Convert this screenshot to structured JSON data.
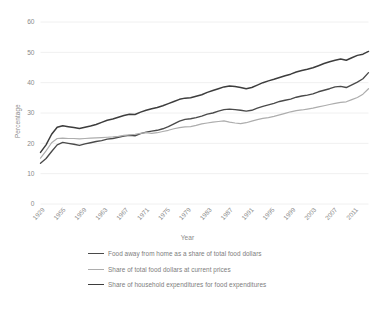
{
  "chart_data": {
    "type": "line",
    "title": "",
    "xlabel": "Year",
    "ylabel": "Percentage",
    "ylim": [
      0,
      60
    ],
    "yticks": [
      0,
      10,
      20,
      30,
      40,
      50,
      60
    ],
    "grid": "horizontal",
    "legend_position": "bottom",
    "x_tick_labels": [
      "1929",
      "1955",
      "1959",
      "1963",
      "1967",
      "1971",
      "1975",
      "1979",
      "1983",
      "1987",
      "1991",
      "1995",
      "1999",
      "2003",
      "2007",
      "2011"
    ],
    "x": [
      1929,
      1955,
      1956,
      1957,
      1958,
      1959,
      1960,
      1961,
      1962,
      1963,
      1964,
      1965,
      1966,
      1967,
      1968,
      1969,
      1970,
      1971,
      1972,
      1973,
      1974,
      1975,
      1976,
      1977,
      1978,
      1979,
      1980,
      1981,
      1982,
      1983,
      1984,
      1985,
      1986,
      1987,
      1988,
      1989,
      1990,
      1991,
      1992,
      1993,
      1994,
      1995,
      1996,
      1997,
      1998,
      1999,
      2000,
      2001,
      2002,
      2003,
      2004,
      2005,
      2006,
      2007,
      2008,
      2009,
      2010,
      2011,
      2012,
      2013
    ],
    "series": [
      {
        "name": "Food away from home as a share of total food dollars",
        "color": "#4a4a4a",
        "values": [
          13.4,
          15.0,
          17.3,
          19.5,
          20.3,
          20.0,
          19.7,
          19.3,
          19.8,
          20.2,
          20.6,
          20.9,
          21.4,
          21.6,
          22.0,
          22.4,
          22.6,
          22.5,
          23.2,
          23.7,
          24.0,
          24.3,
          24.8,
          25.5,
          26.4,
          27.3,
          27.9,
          28.1,
          28.5,
          29.0,
          29.6,
          30.0,
          30.6,
          31.1,
          31.3,
          31.1,
          30.9,
          30.6,
          30.9,
          31.6,
          32.2,
          32.7,
          33.2,
          33.8,
          34.2,
          34.6,
          35.2,
          35.6,
          35.9,
          36.3,
          37.0,
          37.5,
          38.0,
          38.6,
          38.8,
          38.4,
          39.3,
          40.2,
          41.3,
          43.3
        ]
      },
      {
        "name": "Share of total food dollars at current prices",
        "color": "#adadad",
        "values": [
          15.1,
          17.5,
          20.2,
          21.6,
          21.7,
          21.6,
          21.6,
          21.5,
          21.6,
          21.7,
          21.8,
          21.9,
          22.0,
          22.1,
          22.3,
          22.6,
          22.8,
          23.0,
          23.3,
          23.5,
          23.3,
          23.5,
          23.9,
          24.3,
          24.8,
          25.2,
          25.4,
          25.5,
          25.9,
          26.4,
          26.7,
          27.0,
          27.2,
          27.4,
          27.0,
          26.7,
          26.5,
          26.8,
          27.3,
          27.8,
          28.2,
          28.5,
          28.9,
          29.4,
          29.9,
          30.4,
          30.8,
          31.0,
          31.3,
          31.6,
          32.0,
          32.4,
          32.8,
          33.2,
          33.5,
          33.7,
          34.4,
          35.1,
          36.2,
          38.0
        ]
      },
      {
        "name": "Share of household expenditures for food expenditures",
        "color": "#3d3d3d",
        "values": [
          17.0,
          19.5,
          23.0,
          25.3,
          25.8,
          25.5,
          25.2,
          24.9,
          25.3,
          25.7,
          26.2,
          26.9,
          27.6,
          28.0,
          28.6,
          29.2,
          29.6,
          29.5,
          30.3,
          30.9,
          31.4,
          31.8,
          32.4,
          33.1,
          33.8,
          34.5,
          34.9,
          35.0,
          35.5,
          36.0,
          36.8,
          37.4,
          38.0,
          38.6,
          38.9,
          38.7,
          38.4,
          38.0,
          38.4,
          39.2,
          40.0,
          40.6,
          41.1,
          41.7,
          42.3,
          42.8,
          43.5,
          44.0,
          44.4,
          44.9,
          45.6,
          46.3,
          46.9,
          47.4,
          47.8,
          47.4,
          48.2,
          49.0,
          49.4,
          50.3
        ]
      }
    ]
  },
  "axis": {
    "ylabel_text": "Percentage",
    "xlabel_text": "Year"
  },
  "legend": {
    "items": [
      {
        "label": "Food away from home as a share of total food dollars",
        "color": "#4a4a4a",
        "width": "1.4"
      },
      {
        "label": "Share of total food dollars at current prices",
        "color": "#adadad",
        "width": "1.2"
      },
      {
        "label": "Share of household expenditures for food expenditures",
        "color": "#3d3d3d",
        "width": "1.6"
      }
    ]
  },
  "style": {
    "grid_color": "#f0f0f0",
    "tick_text_color": "#8a8a8a",
    "background": "#ffffff"
  }
}
